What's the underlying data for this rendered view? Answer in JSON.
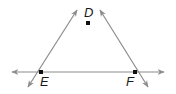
{
  "diagram": {
    "type": "geometry",
    "colors": {
      "line": "#8c8c8c",
      "point": "#111111",
      "label": "#1a1a1a"
    },
    "points": [
      {
        "id": "D",
        "label": "D",
        "x": 88,
        "y": 23
      },
      {
        "id": "E",
        "label": "E",
        "x": 41,
        "y": 72
      },
      {
        "id": "F",
        "label": "F",
        "x": 135,
        "y": 72
      }
    ],
    "lines": [
      {
        "name": "line-EF",
        "through": [
          "E",
          "F"
        ],
        "arrows": "both"
      },
      {
        "name": "line-DE",
        "through": [
          "D",
          "E"
        ],
        "arrows": "both"
      },
      {
        "name": "line-DF",
        "through": [
          "D",
          "F"
        ],
        "arrows": "both"
      }
    ]
  }
}
